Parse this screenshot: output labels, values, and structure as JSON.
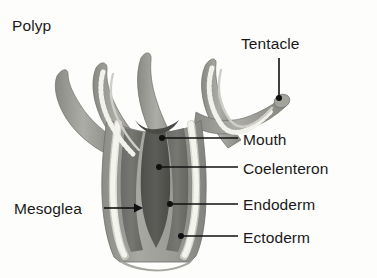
{
  "figure": {
    "title": "Polyp",
    "background_color": "#fdfdfc",
    "text_color": "#1a1a1a",
    "leader_color": "#101010",
    "palette": {
      "ectoderm": "#9a9a96",
      "ectoderm_shadow": "#808079",
      "endoderm": "#6e6e6a",
      "coelenteron": "#565652",
      "mesoglea": "#ddddd6",
      "mesoglea_edge": "#b9b9b1",
      "tentacle_outer": "#a5a5a0",
      "tentacle_dark": "#7b7b76"
    },
    "labels": [
      {
        "id": "polyp",
        "text": "Polyp",
        "has_leader": false
      },
      {
        "id": "tentacle",
        "text": "Tentacle",
        "has_leader": true
      },
      {
        "id": "mouth",
        "text": "Mouth",
        "has_leader": true
      },
      {
        "id": "coelenteron",
        "text": "Coelenteron",
        "has_leader": true
      },
      {
        "id": "endoderm",
        "text": "Endoderm",
        "has_leader": true
      },
      {
        "id": "ectoderm",
        "text": "Ectoderm",
        "has_leader": true
      },
      {
        "id": "mesoglea",
        "text": "Mesoglea",
        "has_leader": true
      }
    ]
  }
}
